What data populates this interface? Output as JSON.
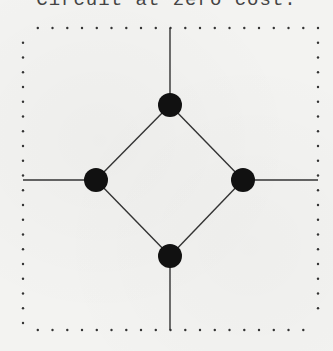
{
  "caption": {
    "text": "Circuit at zero cost.",
    "clipped": true
  },
  "diagram": {
    "type": "graph",
    "colors": {
      "background": "#f3f3f1",
      "node": "#111111",
      "edge": "#333333",
      "border_dots": "#333333"
    },
    "border": {
      "style": "dotted",
      "left": 23,
      "right": 318,
      "top": 28,
      "bottom": 330,
      "dot_spacing": 14.75
    },
    "nodes": [
      {
        "id": "top",
        "x": 170,
        "y": 105,
        "r": 12
      },
      {
        "id": "left",
        "x": 96,
        "y": 180,
        "r": 12
      },
      {
        "id": "right",
        "x": 243,
        "y": 180,
        "r": 12
      },
      {
        "id": "bottom",
        "x": 170,
        "y": 256,
        "r": 12
      }
    ],
    "edges": [
      {
        "from": "top",
        "to": "left"
      },
      {
        "from": "top",
        "to": "right"
      },
      {
        "from": "left",
        "to": "bottom"
      },
      {
        "from": "right",
        "to": "bottom"
      }
    ],
    "leads": [
      {
        "node": "top",
        "to": [
          170,
          28
        ]
      },
      {
        "node": "bottom",
        "to": [
          170,
          330
        ]
      },
      {
        "node": "left",
        "to": [
          23,
          180
        ]
      },
      {
        "node": "right",
        "to": [
          318,
          180
        ]
      }
    ]
  }
}
